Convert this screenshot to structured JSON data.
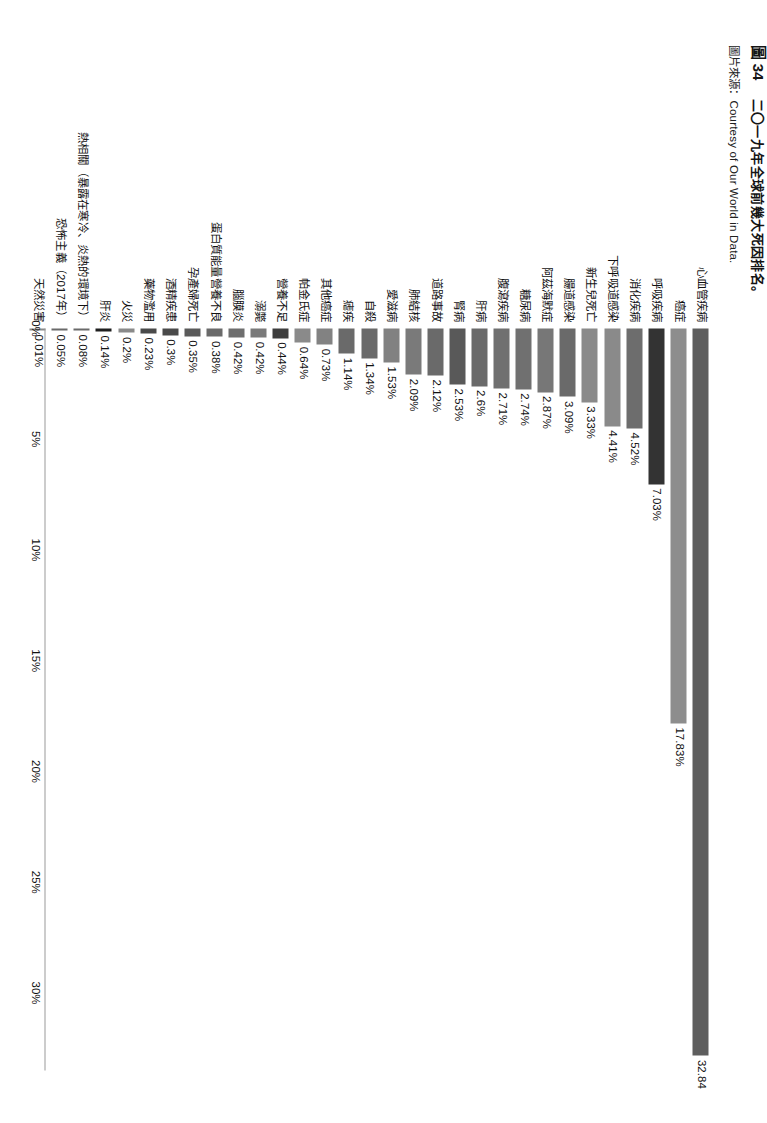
{
  "caption": {
    "figure_number": "圖 34",
    "title": "二〇一九年全球前幾大死因排名。",
    "source": "圖片來源：Courtesy of Our World in Data."
  },
  "chart_data": {
    "type": "bar",
    "orientation": "horizontal",
    "title": "二〇一九年全球前幾大死因排名",
    "xlabel": "",
    "ylabel": "",
    "xlim": [
      0,
      33.5
    ],
    "grid": false,
    "legend": null,
    "value_suffix": "%",
    "axis_ticks": [
      "0%",
      "5%",
      "10%",
      "15%",
      "20%",
      "25%",
      "30%"
    ],
    "axis_tick_values": [
      0,
      5,
      10,
      15,
      20,
      25,
      30
    ],
    "bar_color": "#6e6e6e",
    "categories": [
      "心血管疾病",
      "癌症",
      "呼吸疾病",
      "消化疾病",
      "下呼吸道感染",
      "新生兒死亡",
      "腸道感染",
      "阿茲海默症",
      "糖尿病",
      "腹瀉疾病",
      "肝病",
      "腎病",
      "道路事故",
      "肺結核",
      "愛滋病",
      "自殺",
      "瘧疾",
      "其他癌症",
      "帕金氏症",
      "營養不足",
      "溺斃",
      "腦膜炎",
      "蛋白質能量營養不良",
      "孕產婦死亡",
      "酒精疾患",
      "藥物濫用",
      "火災",
      "肝炎",
      "熱相關（暴露在寒冷、炎熱的環境下）",
      "恐怖主義（2017年）",
      "天然災害"
    ],
    "values": [
      32.84,
      17.83,
      7.03,
      4.52,
      4.41,
      3.33,
      3.09,
      2.87,
      2.74,
      2.71,
      2.6,
      2.53,
      2.12,
      2.09,
      1.53,
      1.34,
      1.14,
      0.73,
      0.64,
      0.44,
      0.42,
      0.42,
      0.38,
      0.35,
      0.3,
      0.23,
      0.2,
      0.14,
      0.08,
      0.05,
      0.01
    ],
    "value_labels": [
      "32.84",
      "17.83%",
      "7.03%",
      "4.52%",
      "4.41%",
      "3.33%",
      "3.09%",
      "2.87%",
      "2.74%",
      "2.71%",
      "2.6%",
      "2.53%",
      "2.12%",
      "2.09%",
      "1.53%",
      "1.34%",
      "1.14%",
      "0.73%",
      "0.64%",
      "0.44%",
      "0.42%",
      "0.42%",
      "0.38%",
      "0.35%",
      "0.3%",
      "0.23%",
      "0.2%",
      "0.14%",
      "0.08%",
      "0.05%",
      "0.01%"
    ],
    "bar_shades": [
      "#5e5e5e",
      "#8d8d8d",
      "#333333",
      "#6d6d6d",
      "#8a8a8a",
      "#8a8a8a",
      "#6a6a6a",
      "#777777",
      "#707070",
      "#707070",
      "#6a6a6a",
      "#595959",
      "#6a6a6a",
      "#7a7a7a",
      "#818181",
      "#6a6a6a",
      "#6a6a6a",
      "#828282",
      "#8a8a8a",
      "#3e3e3e",
      "#7a7a7a",
      "#6e6e6e",
      "#6a6a6a",
      "#5a5a5a",
      "#4a4a4a",
      "#4a4a4a",
      "#8a8a8a",
      "#1f1f1f",
      "#6a6a6a",
      "#6a6a6a",
      "#8a8a8a"
    ]
  }
}
